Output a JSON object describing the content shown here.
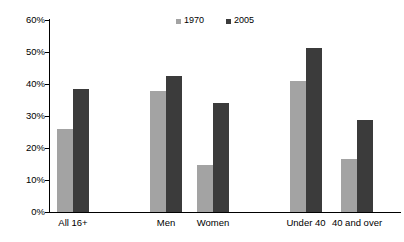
{
  "chart_data": {
    "type": "bar",
    "title": "",
    "subtitle": "",
    "xlabel": "",
    "ylabel": "",
    "ylim": [
      0,
      60
    ],
    "ytick_labels": [
      "0%",
      "10%",
      "20%",
      "30%",
      "40%",
      "50%",
      "60%"
    ],
    "ytick_values": [
      0,
      10,
      20,
      30,
      40,
      50,
      60
    ],
    "grid": false,
    "legend_position": "top-center",
    "categories": [
      "All 16+",
      "Men",
      "Women",
      "Under 40",
      "40 and over"
    ],
    "series": [
      {
        "name": "1970",
        "color": "#a3a3a3",
        "values": [
          26.0,
          37.8,
          14.8,
          41.0,
          16.6
        ]
      },
      {
        "name": "2005",
        "color": "#3b3b3b",
        "values": [
          38.4,
          42.4,
          34.2,
          51.4,
          28.8
        ]
      }
    ],
    "group_positions_px": [
      57,
      150,
      197,
      290,
      341
    ],
    "bar_width_px": 16,
    "annotations": []
  },
  "legend": {
    "items": [
      {
        "label": "1970",
        "color": "#a3a3a3",
        "swatch_name": "legend-swatch-1970"
      },
      {
        "label": "2005",
        "color": "#3b3b3b",
        "swatch_name": "legend-swatch-2005"
      }
    ]
  },
  "axis": {
    "y_labels": [
      "60%",
      "50%",
      "40%",
      "30%",
      "20%",
      "10%",
      "0%"
    ],
    "x_labels": [
      "All 16+",
      "Men",
      "Women",
      "Under 40",
      "40 and over"
    ]
  }
}
